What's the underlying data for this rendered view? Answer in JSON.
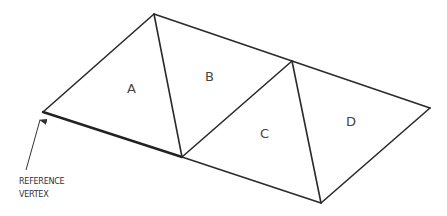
{
  "diagram": {
    "type": "triangle-strip",
    "colors": {
      "line": "#2a2a2a",
      "text": "#444444",
      "background": "#ffffff"
    },
    "vertices": {
      "v0": [
        43,
        112
      ],
      "v1": [
        154,
        14
      ],
      "v2": [
        182,
        157
      ],
      "v3": [
        292,
        61
      ],
      "v4": [
        321,
        203
      ],
      "v5": [
        430,
        108
      ]
    },
    "triangles": [
      {
        "label": "A",
        "vertices": [
          "v0",
          "v1",
          "v2"
        ],
        "label_pos": [
          131,
          92
        ]
      },
      {
        "label": "B",
        "vertices": [
          "v1",
          "v2",
          "v3"
        ],
        "label_pos": [
          209,
          80
        ]
      },
      {
        "label": "C",
        "vertices": [
          "v2",
          "v3",
          "v4"
        ],
        "label_pos": [
          264,
          137
        ]
      },
      {
        "label": "D",
        "vertices": [
          "v3",
          "v4",
          "v5"
        ],
        "label_pos": [
          350,
          125
        ]
      }
    ],
    "annotation": {
      "line1": "REFERENCE",
      "line2": "VERTEX",
      "points_to": "v0"
    }
  }
}
